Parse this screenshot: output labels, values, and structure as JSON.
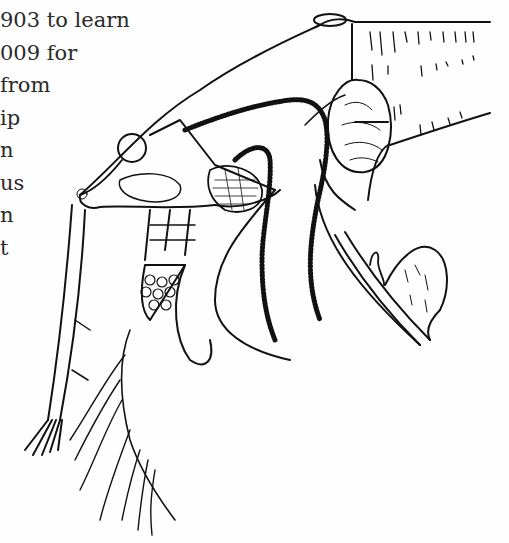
{
  "page": {
    "text_lines": [
      "903 to learn",
      "009 for",
      "from",
      "ip",
      "n",
      "us",
      "n",
      "t"
    ],
    "illustration": {
      "subject": "line-drawing-anatomical-crustacean",
      "ink_color": "#111111",
      "paper_color": "#fefefe"
    }
  }
}
